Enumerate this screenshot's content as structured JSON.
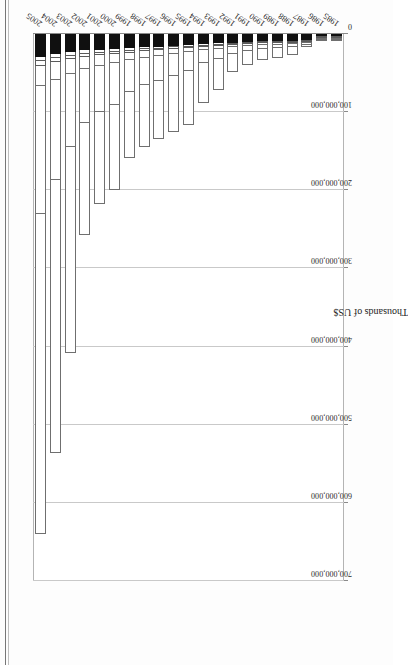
{
  "page": {
    "scan_caption": "Table 7.  2005 figures are net of corrections. Cumulative amounts.",
    "background_color": "#fdfdfd",
    "ink_color": "#1d1d1d"
  },
  "chart_data": {
    "type": "bar",
    "subtype": "stacked-horizontal",
    "title": "",
    "subtitle": "",
    "xlabel": "Thousands of US$",
    "ylabel": "",
    "orientation": "horizontal",
    "rotation_degrees": -90,
    "grid": true,
    "legend_position": "none",
    "xlim": [
      0,
      700000000
    ],
    "xtick_labels": [
      "0",
      "100,000,000",
      "200,000,000",
      "300,000,000",
      "400,000,000",
      "500,000,000",
      "600,000,000",
      "700,000,000"
    ],
    "xtick_values": [
      0,
      100000000,
      200000000,
      300000000,
      400000000,
      500000000,
      600000000,
      700000000
    ],
    "categories": [
      "1985",
      "1986",
      "1987",
      "1988",
      "1989",
      "1990",
      "1991",
      "1992",
      "1993",
      "1994",
      "1995",
      "1996",
      "1997",
      "1998",
      "1999",
      "2000",
      "2001",
      "2002",
      "2003",
      "2004",
      "2005"
    ],
    "series": [
      {
        "name": "Segment 1",
        "style": "black",
        "values": [
          2000000,
          4000000,
          8000000,
          9000000,
          9500000,
          9500000,
          10000000,
          11000000,
          12000000,
          13000000,
          14000000,
          15000000,
          16000000,
          17000000,
          18000000,
          19000000,
          20000000,
          21000000,
          23000000,
          26000000,
          29000000
        ]
      },
      {
        "name": "Segment 2",
        "style": "white-thin",
        "values": [
          300000,
          700000,
          1500000,
          2000000,
          2000000,
          2000000,
          2500000,
          2500000,
          3000000,
          3000000,
          3500000,
          3500000,
          4000000,
          4000000,
          4500000,
          5000000,
          5000000,
          5500000,
          6000000,
          6500000,
          7000000
        ]
      },
      {
        "name": "Segment 3",
        "style": "white-thin",
        "values": [
          200000,
          500000,
          1200000,
          1500000,
          1500000,
          1500000,
          2000000,
          2000000,
          2500000,
          2500000,
          3000000,
          3000000,
          3500000,
          3500000,
          4000000,
          4000000,
          4500000,
          5000000,
          5500000,
          6000000,
          7000000
        ]
      },
      {
        "name": "Segment 4",
        "style": "white",
        "values": [
          300000,
          800000,
          2000000,
          3000000,
          3000000,
          3000000,
          3500000,
          4000000,
          5000000,
          6000000,
          7000000,
          8000000,
          9000000,
          10000000,
          11000000,
          13000000,
          15000000,
          17000000,
          20000000,
          24000000,
          28000000
        ]
      },
      {
        "name": "Segment 5",
        "style": "white",
        "values": [
          400000,
          1000000,
          3000000,
          5000000,
          6000000,
          6500000,
          8000000,
          10000000,
          14000000,
          18000000,
          25000000,
          30000000,
          33000000,
          36000000,
          42000000,
          55000000,
          60000000,
          70000000,
          95000000,
          130000000,
          165000000
        ]
      },
      {
        "name": "Segment 6",
        "style": "white",
        "values": [
          300000,
          1000000,
          4000000,
          11000000,
          14000000,
          15000000,
          19000000,
          25000000,
          42000000,
          52000000,
          70000000,
          72000000,
          75000000,
          80000000,
          85000000,
          110000000,
          120000000,
          145000000,
          265000000,
          350000000,
          410000000
        ]
      }
    ],
    "totals": [
      3500000,
      8000000,
      19700000,
      31500000,
      36000000,
      37500000,
      45000000,
      54500000,
      78500000,
      94500000,
      122500000,
      131500000,
      140500000,
      150500000,
      164500000,
      206000000,
      224500000,
      263500000,
      414500000,
      542500000,
      646000000
    ]
  },
  "icons": {
    "chart_area": "bar-chart-icon"
  }
}
